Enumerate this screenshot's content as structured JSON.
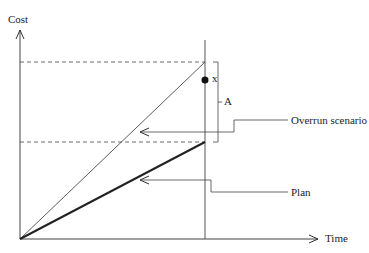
{
  "axes": {
    "y_label": "Cost",
    "x_label": "Time"
  },
  "labels": {
    "point_marker": "x",
    "bracket": "A",
    "overrun_scenario": "Overrun scenario",
    "plan": "Plan"
  },
  "colors": {
    "line": "#333333",
    "dashed": "#444444",
    "background": "#ffffff"
  }
}
